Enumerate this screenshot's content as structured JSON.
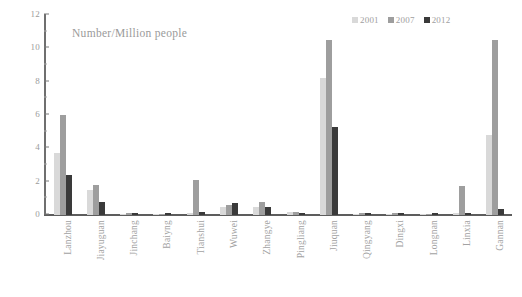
{
  "chart_data": {
    "type": "bar",
    "title": "Number/Million people",
    "xlabel": "",
    "ylabel": "",
    "ylim": [
      0,
      12
    ],
    "yticks": [
      0,
      2,
      4,
      6,
      8,
      10,
      12
    ],
    "grid": false,
    "legend_position": "top-right",
    "categories": [
      "Lanzhou",
      "Jiayuguan",
      "Jinchang",
      "Baiyng",
      "Tianshui",
      "Wuwei",
      "Zhangye",
      "Pingliang",
      "Jiuquan",
      "Qingyang",
      "Dingxi",
      "Longnan",
      "Linxia",
      "Gannan"
    ],
    "series": [
      {
        "name": "2001",
        "color": "#d9d9d9",
        "values": [
          3.7,
          1.5,
          0.05,
          0.05,
          0.15,
          0.5,
          0.5,
          0.2,
          8.2,
          0.05,
          0.05,
          0.05,
          0.1,
          4.8
        ]
      },
      {
        "name": "2007",
        "color": "#9e9e9e",
        "values": [
          6.0,
          1.8,
          0.1,
          0.05,
          2.1,
          0.6,
          0.8,
          0.2,
          10.5,
          0.1,
          0.1,
          0.05,
          1.75,
          10.5
        ]
      },
      {
        "name": "2012",
        "color": "#3a3a3a",
        "values": [
          2.4,
          0.8,
          0.15,
          0.15,
          0.2,
          0.7,
          0.5,
          0.1,
          5.3,
          0.15,
          0.1,
          0.15,
          0.15,
          0.35
        ]
      }
    ]
  }
}
